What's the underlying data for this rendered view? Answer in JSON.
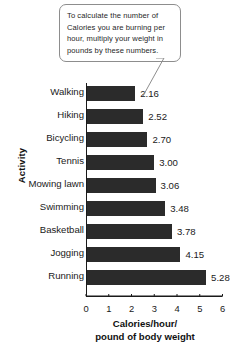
{
  "callout": {
    "text": "To calculate the number of Calories you are burning per hour, multiply your weight in pounds by these numbers.",
    "border_color": "#8d8d8d"
  },
  "chart_data": {
    "type": "bar",
    "orientation": "horizontal",
    "title": "",
    "xlabel": "Calories/hour/\npound of body weight",
    "ylabel": "Activity",
    "xlim": [
      0,
      6
    ],
    "xticks": [
      0,
      1,
      2,
      3,
      4,
      5,
      6
    ],
    "xtick_labels": [
      "0",
      "1",
      "2",
      "3",
      "4",
      "5",
      "6"
    ],
    "grid": false,
    "legend": false,
    "bar_color": "#2b2b2b",
    "categories": [
      "Walking",
      "Hiking",
      "Bicycling",
      "Tennis",
      "Mowing lawn",
      "Swimming",
      "Basketball",
      "Jogging",
      "Running"
    ],
    "values": [
      2.16,
      2.52,
      2.7,
      3.0,
      3.06,
      3.48,
      3.78,
      4.15,
      5.28
    ],
    "value_labels": [
      "2.16",
      "2.52",
      "2.70",
      "3.00",
      "3.06",
      "3.48",
      "3.78",
      "4.15",
      "5.28"
    ]
  }
}
